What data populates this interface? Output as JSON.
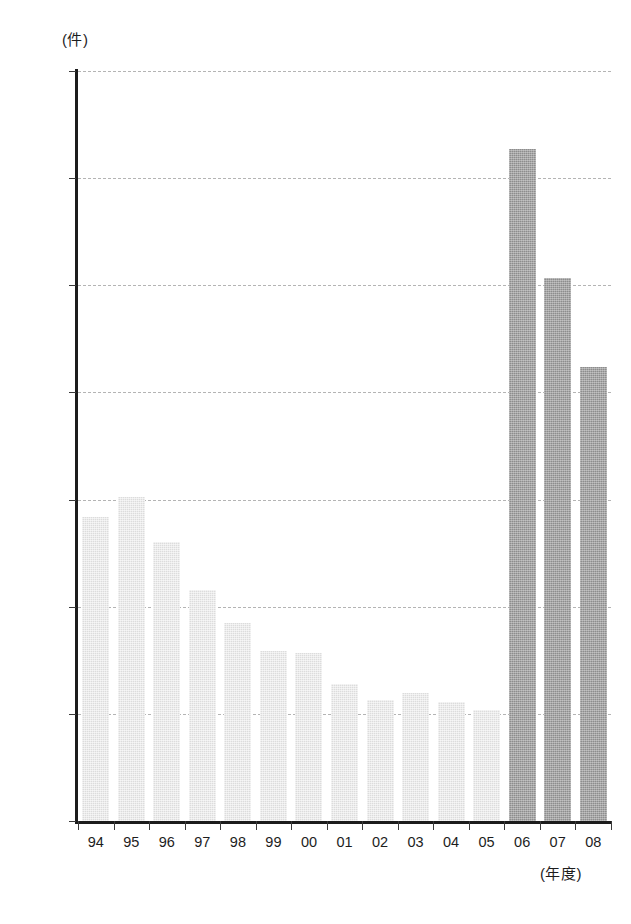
{
  "chart_data": {
    "type": "bar",
    "title": "",
    "subtitle": "",
    "xlabel": "(年度)",
    "ylabel": "(件)",
    "ylim": [
      0,
      140000
    ],
    "xlim_categories": 15,
    "grid": true,
    "grid_axis": "y",
    "legend": null,
    "categories": [
      "94",
      "95",
      "96",
      "97",
      "98",
      "99",
      "00",
      "01",
      "02",
      "03",
      "04",
      "05",
      "06",
      "07",
      "08"
    ],
    "values": [
      56800,
      60400,
      52000,
      43200,
      37000,
      31800,
      31400,
      25600,
      22600,
      23900,
      22300,
      20800,
      125400,
      101300,
      84800
    ],
    "y_ticks": [
      0,
      20000,
      40000,
      60000,
      80000,
      100000,
      120000,
      140000
    ],
    "y_tick_labels": [
      "0",
      "20000",
      "40000",
      "60000",
      "80000",
      "100000",
      "120000",
      "140000"
    ],
    "bar_colors": [
      "#dcdcdc",
      "#dcdcdc",
      "#dcdcdc",
      "#dcdcdc",
      "#dcdcdc",
      "#dcdcdc",
      "#dcdcdc",
      "#dcdcdc",
      "#dcdcdc",
      "#dcdcdc",
      "#dcdcdc",
      "#dcdcdc",
      "#8d8d8d",
      "#8d8d8d",
      "#8d8d8d"
    ],
    "series": [
      {
        "name": "件数",
        "values": [
          56800,
          60400,
          52000,
          43200,
          37000,
          31800,
          31400,
          25600,
          22600,
          23900,
          22300,
          20800,
          125400,
          101300,
          84800
        ]
      }
    ],
    "colors": {
      "bar_light": "#dcdcdc",
      "bar_dark": "#8d8d8d",
      "axis": "#1c1c1c",
      "gridline": "#b4b4b4",
      "text": "#1d1d1d"
    }
  }
}
